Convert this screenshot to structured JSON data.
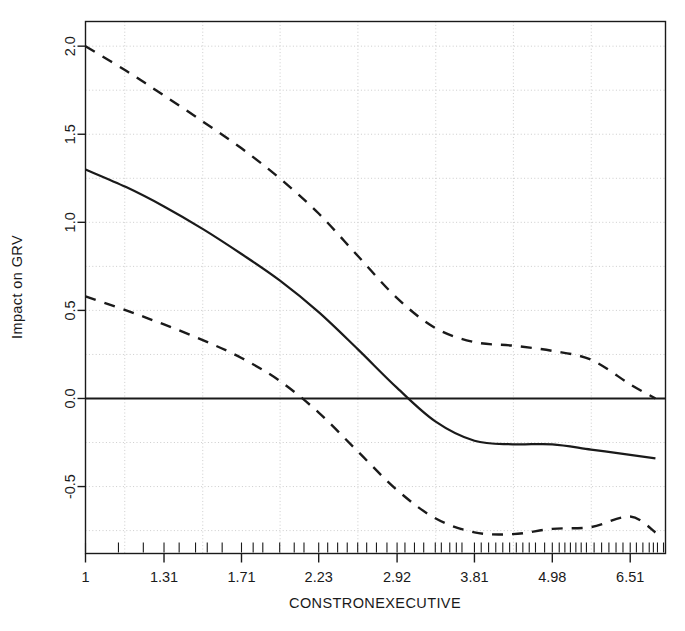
{
  "chart_data": {
    "type": "line",
    "title": "",
    "subtitle": "",
    "xlabel": "CONSTRONEXECUTIVE",
    "ylabel": "Impact on GRV",
    "xscale": "log",
    "xlim": [
      1.0,
      7.35
    ],
    "ylim": [
      -0.88,
      2.14
    ],
    "grid": true,
    "grid_style": "dotted",
    "grid_color": "#cccccc",
    "legend": "none",
    "x_tick_labels": [
      "1",
      "1.31",
      "1.71",
      "2.23",
      "2.92",
      "3.81",
      "4.98",
      "6.51"
    ],
    "x_tick_values": [
      1,
      1.31,
      1.71,
      2.23,
      2.92,
      3.81,
      4.98,
      6.51
    ],
    "y_tick_labels": [
      "-0.5",
      "0.0",
      "0.5",
      "1.0",
      "1.5",
      "2.0"
    ],
    "y_tick_values": [
      -0.5,
      0.0,
      0.5,
      1.0,
      1.5,
      2.0
    ],
    "series": [
      {
        "name": "Marginal effect estimate",
        "style": "solid",
        "color": "#1a1a1a",
        "x": [
          1.0,
          1.15,
          1.31,
          1.5,
          1.71,
          1.95,
          2.23,
          2.55,
          2.92,
          3.33,
          3.81,
          4.35,
          4.98,
          5.69,
          6.51,
          7.1
        ],
        "y": [
          1.3,
          1.2,
          1.09,
          0.96,
          0.82,
          0.67,
          0.49,
          0.28,
          0.06,
          -0.13,
          -0.24,
          -0.26,
          -0.26,
          -0.29,
          -0.32,
          -0.34
        ]
      },
      {
        "name": "Upper 95% confidence bound",
        "style": "dashed",
        "color": "#1a1a1a",
        "x": [
          1.0,
          1.15,
          1.31,
          1.5,
          1.71,
          1.95,
          2.23,
          2.55,
          2.92,
          3.33,
          3.81,
          4.35,
          4.98,
          5.69,
          6.51,
          7.1
        ],
        "y": [
          2.0,
          1.86,
          1.72,
          1.57,
          1.42,
          1.25,
          1.05,
          0.81,
          0.57,
          0.4,
          0.32,
          0.3,
          0.27,
          0.22,
          0.08,
          0.0
        ]
      },
      {
        "name": "Lower 95% confidence bound",
        "style": "dashed",
        "color": "#1a1a1a",
        "x": [
          1.0,
          1.15,
          1.31,
          1.5,
          1.71,
          1.95,
          2.23,
          2.55,
          2.92,
          3.33,
          3.81,
          4.35,
          4.98,
          5.69,
          6.51,
          7.1
        ],
        "y": [
          0.58,
          0.5,
          0.42,
          0.33,
          0.23,
          0.1,
          -0.08,
          -0.3,
          -0.52,
          -0.68,
          -0.76,
          -0.77,
          -0.74,
          -0.73,
          -0.67,
          -0.76
        ]
      }
    ],
    "rug": {
      "name": "data-rug-marks",
      "values": [
        1.0,
        1.12,
        1.22,
        1.31,
        1.38,
        1.46,
        1.52,
        1.6,
        1.71,
        1.78,
        1.84,
        1.95,
        2.05,
        2.12,
        2.23,
        2.3,
        2.38,
        2.46,
        2.55,
        2.63,
        2.72,
        2.82,
        2.92,
        3.0,
        3.1,
        3.2,
        3.33,
        3.4,
        3.5,
        3.58,
        3.65,
        3.81,
        3.9,
        4.0,
        4.1,
        4.2,
        4.3,
        4.4,
        4.5,
        4.6,
        4.7,
        4.85,
        4.98,
        5.1,
        5.2,
        5.3,
        5.4,
        5.5,
        5.6,
        5.75,
        5.9,
        6.05,
        6.2,
        6.35,
        6.51,
        6.65,
        6.8,
        6.95,
        7.05,
        7.15,
        7.3
      ]
    }
  },
  "axes": {
    "x_title": "CONSTRONEXECUTIVE",
    "y_title": "Impact on GRV"
  }
}
